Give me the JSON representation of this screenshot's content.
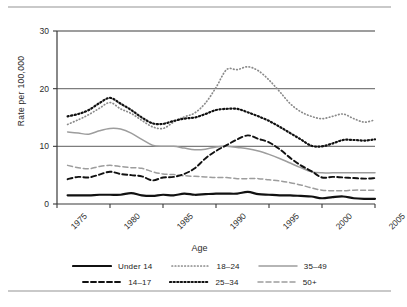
{
  "figure": {
    "axis_title": "Age",
    "ylabel": "Rate per 100,000"
  },
  "chart_data": {
    "type": "line",
    "title": "",
    "xlabel": "Age",
    "ylabel": "Rate per 100,000",
    "xlim": [
      1975,
      2005
    ],
    "ylim": [
      0,
      30
    ],
    "xticks": [
      "1975",
      "1980",
      "1985",
      "1990",
      "1995",
      "2000",
      "2005"
    ],
    "yticks": [
      "0",
      "10",
      "20",
      "30"
    ],
    "grid": "horizontal",
    "legend_position": "bottom",
    "x": [
      1976,
      1977,
      1978,
      1979,
      1980,
      1981,
      1982,
      1983,
      1984,
      1985,
      1986,
      1987,
      1988,
      1989,
      1990,
      1991,
      1992,
      1993,
      1994,
      1995,
      1996,
      1997,
      1998,
      1999,
      2000,
      2001,
      2002,
      2003,
      2004,
      2005
    ],
    "series": [
      {
        "name": "Under 14",
        "color": "#111111",
        "style": "solid-thick",
        "values": [
          1.5,
          1.5,
          1.5,
          1.6,
          1.6,
          1.6,
          1.9,
          1.5,
          1.4,
          1.6,
          1.5,
          1.8,
          1.6,
          1.7,
          1.8,
          1.8,
          1.8,
          2.1,
          1.7,
          1.6,
          1.5,
          1.5,
          1.4,
          1.3,
          1.0,
          1.2,
          1.3,
          1.0,
          0.9,
          0.9
        ]
      },
      {
        "name": "14-17",
        "color": "#111111",
        "style": "dashed",
        "values": [
          4.3,
          4.7,
          4.6,
          5.1,
          5.6,
          5.2,
          5.0,
          4.8,
          4.1,
          4.6,
          4.7,
          5.2,
          6.2,
          7.9,
          9.2,
          10.2,
          11.2,
          11.9,
          11.3,
          10.7,
          9.5,
          8.0,
          6.7,
          5.7,
          4.6,
          4.7,
          4.6,
          4.5,
          4.4,
          4.5
        ]
      },
      {
        "name": "18-24",
        "color": "#8a8a8a",
        "style": "dotted-fine",
        "values": [
          13.8,
          14.6,
          15.5,
          16.6,
          17.6,
          16.5,
          15.7,
          14.5,
          13.4,
          13.1,
          14.2,
          15.1,
          15.8,
          17.5,
          20.2,
          23.3,
          23.3,
          23.8,
          23.1,
          21.5,
          19.5,
          17.4,
          16.0,
          15.2,
          14.8,
          15.2,
          15.6,
          14.8,
          14.2,
          14.6
        ]
      },
      {
        "name": "25-34",
        "color": "#111111",
        "style": "dotted-bold",
        "values": [
          15.2,
          15.6,
          16.3,
          17.5,
          18.4,
          17.4,
          16.3,
          15.0,
          14.0,
          13.9,
          14.4,
          14.8,
          15.0,
          15.6,
          16.3,
          16.5,
          16.5,
          15.9,
          15.2,
          14.4,
          13.4,
          12.3,
          11.2,
          10.1,
          10.0,
          10.5,
          11.1,
          11.1,
          11.0,
          11.2
        ]
      },
      {
        "name": "35-49",
        "color": "#9d9d9d",
        "style": "solid-thin",
        "values": [
          12.5,
          12.3,
          12.1,
          12.7,
          13.1,
          13.0,
          12.3,
          11.2,
          10.2,
          10.0,
          10.0,
          9.7,
          9.4,
          9.5,
          9.9,
          10.0,
          9.8,
          9.6,
          9.2,
          8.6,
          7.9,
          7.1,
          6.3,
          5.6,
          5.4,
          5.4,
          5.4,
          5.4,
          5.4,
          5.4
        ]
      },
      {
        "name": "50+",
        "color": "#9d9d9d",
        "style": "dashed-gray",
        "values": [
          6.7,
          6.3,
          6.1,
          6.5,
          6.7,
          6.5,
          6.3,
          6.2,
          5.6,
          5.2,
          5.1,
          4.9,
          4.8,
          4.7,
          4.6,
          4.6,
          4.4,
          4.4,
          4.4,
          4.2,
          4.0,
          3.7,
          3.3,
          2.8,
          2.4,
          2.3,
          2.3,
          2.4,
          2.4,
          2.4
        ]
      }
    ]
  },
  "legend": {
    "rows": [
      [
        {
          "label": "Under 14",
          "key": "under-14"
        },
        {
          "label": "18–24",
          "key": "18-24"
        },
        {
          "label": "35–49",
          "key": "35-49"
        }
      ],
      [
        {
          "label": "14–17",
          "key": "14-17"
        },
        {
          "label": "25–34",
          "key": "25-34"
        },
        {
          "label": "50+",
          "key": "50plus"
        }
      ]
    ]
  }
}
